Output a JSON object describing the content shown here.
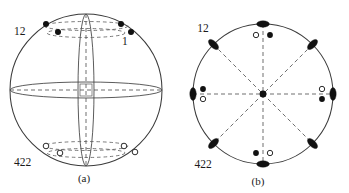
{
  "figure": {
    "type": "crystallographic-stereographic-projection",
    "panels": [
      {
        "id": "a",
        "caption": "(a)",
        "caption_x": 84,
        "caption_y": 182,
        "labels": [
          {
            "name": "point-group-top",
            "text": "12",
            "x": 14,
            "y": 35
          },
          {
            "name": "pole-label-one",
            "text": "1",
            "x": 122,
            "y": 45
          },
          {
            "name": "point-group-bottom",
            "text": "422",
            "x": 14,
            "y": 166
          }
        ],
        "sphere": {
          "cx": 86,
          "cy": 90,
          "r": 76
        },
        "equator_ellipse": {
          "cx": 86,
          "cy": 90,
          "rx": 76,
          "ry": 8
        },
        "meridian_lens": {
          "cx": 86,
          "cy": 90,
          "rx": 8,
          "ry": 76
        },
        "upper_guides": [
          {
            "name": "upper-dashed-ellipse-outer",
            "cx": 86,
            "cy": 26,
            "rx": 42,
            "ry": 4.5
          },
          {
            "name": "upper-dashed-ellipse-inner",
            "cx": 86,
            "cy": 33,
            "rx": 39,
            "ry": 4.5
          }
        ],
        "lower_guides": [
          {
            "name": "lower-dashed-ellipse-outer",
            "cx": 86,
            "cy": 146,
            "rx": 42,
            "ry": 4.5
          },
          {
            "name": "lower-dashed-ellipse-inner",
            "cx": 86,
            "cy": 153,
            "rx": 39,
            "ry": 4.5
          }
        ],
        "filled_poles": [
          {
            "name": "pole-upper-left-outer",
            "x": 46,
            "y": 24,
            "r": 3.0
          },
          {
            "name": "pole-upper-right-outer",
            "x": 121,
            "y": 24,
            "r": 3.0
          },
          {
            "name": "pole-upper-left-inner",
            "x": 58,
            "y": 32,
            "r": 3.0
          },
          {
            "name": "pole-upper-right-inner",
            "x": 131,
            "y": 32,
            "r": 3.0
          }
        ],
        "open_poles": [
          {
            "name": "pole-lower-left-outer",
            "x": 46,
            "y": 146,
            "r": 2.8
          },
          {
            "name": "pole-lower-right-outer",
            "x": 124,
            "y": 146,
            "r": 2.8
          },
          {
            "name": "pole-lower-left-inner",
            "x": 60,
            "y": 153,
            "r": 2.8
          },
          {
            "name": "pole-lower-right-inner",
            "x": 135,
            "y": 152,
            "r": 2.8
          }
        ]
      },
      {
        "id": "b",
        "caption": "(b)",
        "caption_x": 258,
        "caption_y": 185,
        "labels": [
          {
            "name": "point-group-top",
            "text": "12",
            "x": 203,
            "y": 32
          },
          {
            "name": "point-group-bottom",
            "text": "422",
            "x": 203,
            "y": 168
          }
        ],
        "circle": {
          "cx": 263,
          "cy": 94,
          "r": 70
        },
        "diameters": [
          {
            "name": "diameter-vertical",
            "angle_deg": 90
          },
          {
            "name": "diameter-horizontal",
            "angle_deg": 0
          },
          {
            "name": "diameter-diagonal-ne",
            "angle_deg": 45
          },
          {
            "name": "diameter-diagonal-nw",
            "angle_deg": 135
          }
        ],
        "center_marker": {
          "name": "center-point",
          "x": 263,
          "y": 94,
          "r": 3.4
        },
        "mirror_lenses": [
          {
            "name": "mirror-lens-n",
            "angle_deg": 90,
            "rx": 3.2,
            "ry": 6.4
          },
          {
            "name": "mirror-lens-ne",
            "angle_deg": 45,
            "rx": 3.2,
            "ry": 6.4
          },
          {
            "name": "mirror-lens-e",
            "angle_deg": 0,
            "rx": 3.2,
            "ry": 6.4
          },
          {
            "name": "mirror-lens-se",
            "angle_deg": -45,
            "rx": 3.2,
            "ry": 6.4
          },
          {
            "name": "mirror-lens-s",
            "angle_deg": -90,
            "rx": 3.2,
            "ry": 6.4
          },
          {
            "name": "mirror-lens-sw",
            "angle_deg": -135,
            "rx": 3.2,
            "ry": 6.4
          },
          {
            "name": "mirror-lens-w",
            "angle_deg": 180,
            "rx": 3.2,
            "ry": 6.4
          },
          {
            "name": "mirror-lens-nw",
            "angle_deg": 135,
            "rx": 3.2,
            "ry": 6.4
          }
        ],
        "filled_poles": [
          {
            "name": "pole-top-right",
            "x": 270,
            "y": 35,
            "r": 2.9
          },
          {
            "name": "pole-left-upper",
            "x": 203,
            "y": 89,
            "r": 2.9
          },
          {
            "name": "pole-right-lower",
            "x": 322,
            "y": 99,
            "r": 2.9
          },
          {
            "name": "pole-bottom-left",
            "x": 256,
            "y": 153,
            "r": 2.9
          }
        ],
        "open_poles": [
          {
            "name": "pole-top-left",
            "x": 256,
            "y": 35,
            "r": 2.7
          },
          {
            "name": "pole-left-lower",
            "x": 203,
            "y": 99,
            "r": 2.7
          },
          {
            "name": "pole-right-upper",
            "x": 322,
            "y": 89,
            "r": 2.7
          },
          {
            "name": "pole-bottom-right",
            "x": 270,
            "y": 153,
            "r": 2.7
          }
        ]
      }
    ]
  },
  "colors": {
    "stroke": "#3a3a3a",
    "dash": "#555555",
    "filled": "#111111",
    "open_fill": "#ffffff",
    "text": "#1a1a1a"
  }
}
